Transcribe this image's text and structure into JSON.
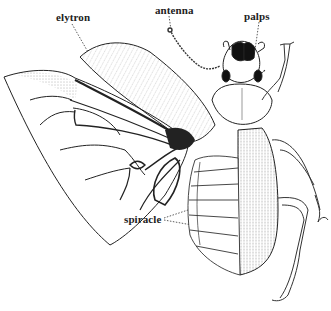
{
  "diagram": {
    "labels": [
      {
        "id": "elytron",
        "text": "elytron",
        "x": 56,
        "y": 11
      },
      {
        "id": "antenna",
        "text": "antenna",
        "x": 155,
        "y": 4
      },
      {
        "id": "palps",
        "text": "palps",
        "x": 244,
        "y": 10
      },
      {
        "id": "spiracle",
        "text": "spiracle",
        "x": 124,
        "y": 213
      }
    ],
    "colors": {
      "ink": "#222222",
      "background": "#ffffff"
    }
  }
}
